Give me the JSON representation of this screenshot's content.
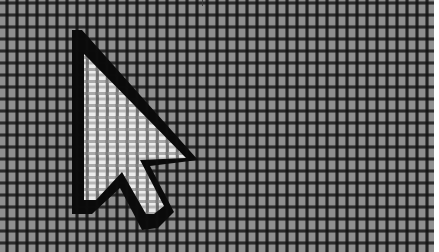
{
  "scene": {
    "description": "Macro photograph of an LCD screen showing a mouse pointer arrow rendered on the pixel grid",
    "subject": "arrow-cursor",
    "colors": {
      "screen_gray": "#8f8f8f",
      "grid_dark": "#141414",
      "cursor_fill": "#e6e6e6",
      "cursor_outline": "#0a0a0a",
      "edge_white": "#ffffff"
    }
  }
}
